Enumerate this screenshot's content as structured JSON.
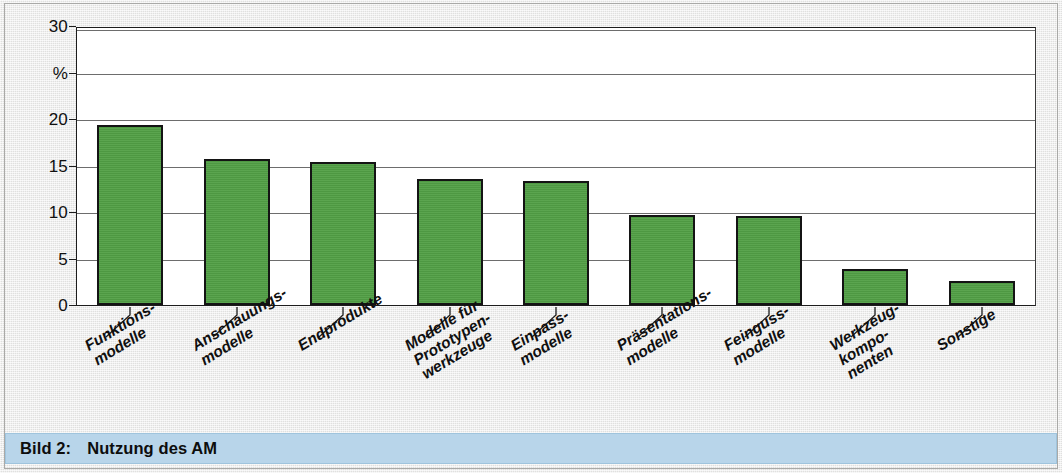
{
  "caption": {
    "number": "Bild 2:",
    "title": "Nutzung des AM"
  },
  "chart_data": {
    "type": "bar",
    "title": "Nutzung des AM",
    "xlabel": "",
    "ylabel": "%",
    "ylim": [
      0,
      30
    ],
    "yticks": [
      0,
      5,
      10,
      15,
      20,
      25,
      30
    ],
    "ytick_labels": [
      "0",
      "5",
      "10",
      "15",
      "20",
      "%",
      "30"
    ],
    "grid": true,
    "legend": "none",
    "bar_color": "#52a046",
    "bar_edge_color": "#141414",
    "plot_background": "#ffffff",
    "figure_background": "#ececeb",
    "categories": [
      "Funktions-\nmodelle",
      "Anschauungs-\nmodelle",
      "Endprodukte",
      "Modelle für\nPrototypen-\nwerkzeuge",
      "Einpass-\nmodelle",
      "Präsentations-\nmodelle",
      "Feinguss-\nmodelle",
      "Werkzeug-\nkompo-\nnenten",
      "Sonstige"
    ],
    "category_lines": [
      [
        "Funktions-",
        "modelle"
      ],
      [
        "Anschauungs-",
        "modelle"
      ],
      [
        "Endprodukte"
      ],
      [
        "Modelle für",
        "Prototypen-",
        "werkzeuge"
      ],
      [
        "Einpass-",
        "modelle"
      ],
      [
        "Präsentations-",
        "modelle"
      ],
      [
        "Feinguss-",
        "modelle"
      ],
      [
        "Werkzeug-",
        "kompo-",
        "nenten"
      ],
      [
        "Sonstige"
      ]
    ],
    "values": [
      19.5,
      15.8,
      15.5,
      13.6,
      13.4,
      9.8,
      9.6,
      3.9,
      2.6
    ]
  }
}
